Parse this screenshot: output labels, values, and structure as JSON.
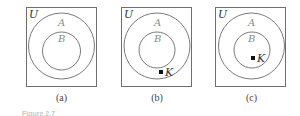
{
  "figure": {
    "caption_partial": "Figure 2.7",
    "panels": [
      {
        "id": "a",
        "label": "(a)",
        "universe": "U",
        "outer_set": "A",
        "inner_set": "B",
        "element": null
      },
      {
        "id": "b",
        "label": "(b)",
        "universe": "U",
        "outer_set": "A",
        "inner_set": "B",
        "element": "K",
        "element_location": "in A but not in B"
      },
      {
        "id": "c",
        "label": "(c)",
        "universe": "U",
        "outer_set": "A",
        "inner_set": "B",
        "element": "K",
        "element_location": "in B"
      }
    ]
  },
  "colors": {
    "stroke": "#6e6e6e",
    "text_gray": "#8a8a8a",
    "text_dark": "#333333",
    "point": "#111111"
  }
}
